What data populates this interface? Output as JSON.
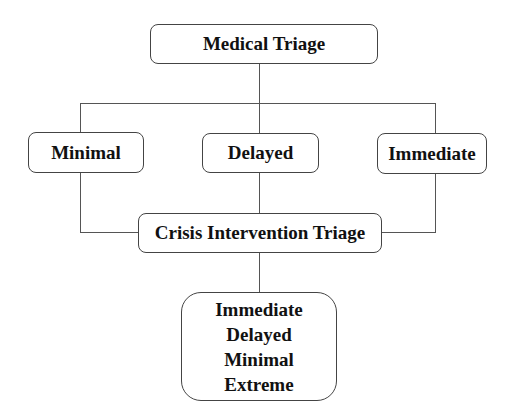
{
  "diagram": {
    "root": {
      "label": "Medical Triage"
    },
    "level1": [
      {
        "label": "Minimal"
      },
      {
        "label": "Delayed"
      },
      {
        "label": "Immediate"
      }
    ],
    "merge": {
      "label": "Crisis Intervention Triage"
    },
    "outcome": {
      "items": [
        "Immediate",
        "Delayed",
        "Minimal",
        "Extreme"
      ]
    },
    "colors": {
      "stroke": "#444444",
      "text": "#111111",
      "background": "#ffffff"
    }
  }
}
